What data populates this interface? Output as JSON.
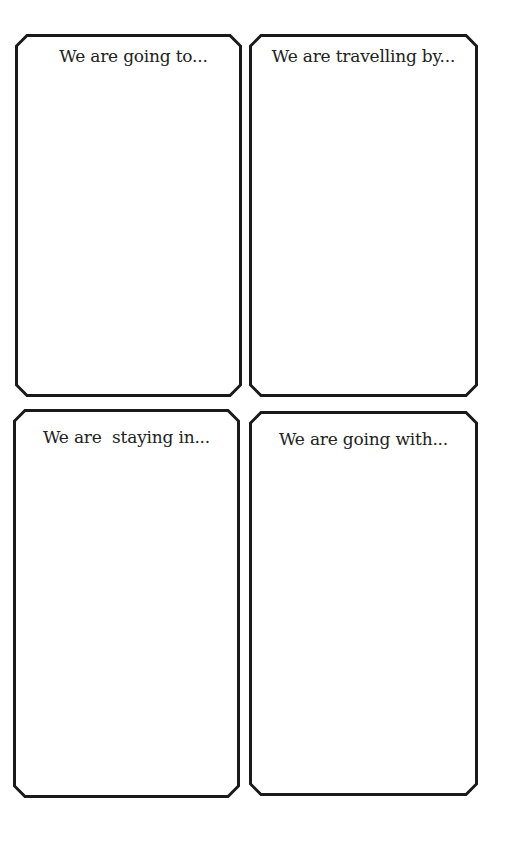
{
  "cards": [
    {
      "label": "We are going to...",
      "x": 15,
      "y": 34,
      "w": 227,
      "h": 363
    },
    {
      "label": "We are travelling by...",
      "x": 249,
      "y": 34,
      "w": 229,
      "h": 363
    },
    {
      "label": "We are  staying in...",
      "x": 13,
      "y": 409,
      "w": 227,
      "h": 389
    },
    {
      "label": "We are going with...",
      "x": 249,
      "y": 411,
      "w": 229,
      "h": 385
    }
  ],
  "colors": {
    "stroke": "#1a1a1a",
    "text": "#222222",
    "background": "#ffffff"
  }
}
